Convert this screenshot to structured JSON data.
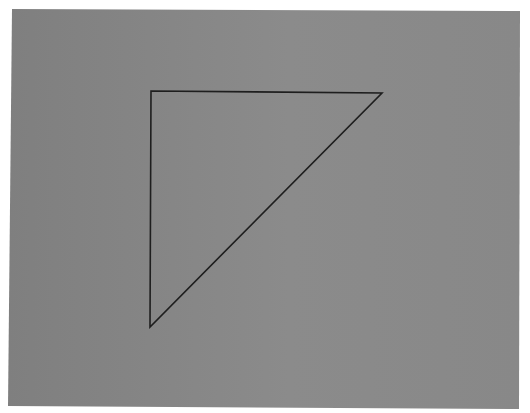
{
  "canvas": {
    "width": 530,
    "height": 413,
    "background": "#ffffff"
  },
  "panel": {
    "shape": "quadrilateral",
    "corners": [
      [
        12,
        9
      ],
      [
        520,
        11
      ],
      [
        519,
        409
      ],
      [
        8,
        406
      ]
    ],
    "fill_left": "#7f7f7f",
    "fill_center": "#8b8b8b",
    "fill_right": "#888888"
  },
  "triangle": {
    "shape": "right-triangle-outline",
    "vertices": [
      [
        151,
        91
      ],
      [
        382,
        93
      ],
      [
        150,
        327
      ]
    ],
    "stroke": "#1e1e1e",
    "stroke_width": 1.6,
    "fill": "none"
  }
}
